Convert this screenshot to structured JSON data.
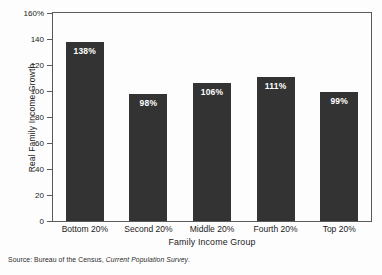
{
  "chart_data": {
    "type": "bar",
    "title": "",
    "categories": [
      "Bottom 20%",
      "Second 20%",
      "Middle 20%",
      "Fourth 20%",
      "Top 20%"
    ],
    "values": [
      138,
      98,
      106,
      111,
      99
    ],
    "value_labels": [
      "138%",
      "98%",
      "106%",
      "111%",
      "99%"
    ],
    "xlabel": "Family Income Group",
    "ylabel": "Real Family Income Growth",
    "ylim": [
      0,
      160
    ],
    "ytick_labels": [
      "0",
      "20",
      "40",
      "60",
      "80",
      "100",
      "120",
      "140",
      "160%"
    ],
    "ytick_values": [
      0,
      20,
      40,
      60,
      80,
      100,
      120,
      140,
      160
    ],
    "grid": false,
    "legend": null,
    "bar_color": "#333333",
    "value_label_color": "#ffffff",
    "axis_color": "#5a5a5a",
    "background_color": "#fdfdfd"
  },
  "source": {
    "prefix": "Source: Bureau of the Census, ",
    "italic": "Current Population Survey",
    "suffix": "."
  }
}
